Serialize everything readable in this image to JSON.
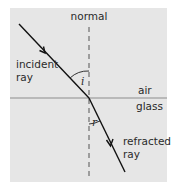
{
  "diagram": {
    "labels": {
      "normal": "normal",
      "incident_line1": "incident",
      "incident_line2": "ray",
      "refracted_line1": "refracted",
      "refracted_line2": "ray",
      "medium_top": "air",
      "medium_bottom": "glass",
      "angle_incidence": "i",
      "angle_refraction": "r"
    },
    "colors": {
      "panel_background": "#e6e6e6",
      "ray": "#111111",
      "normal": "#555555",
      "interface": "#8c8c8c",
      "text": "#2a2a2a"
    }
  }
}
